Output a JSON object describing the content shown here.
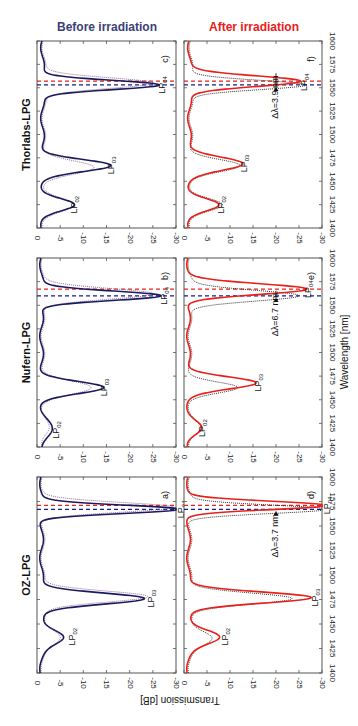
{
  "figure": {
    "column_titles": [
      {
        "label": "Before irradiation",
        "color": "#3b3f7a"
      },
      {
        "label": "After irradiation",
        "color": "#e8201a"
      }
    ],
    "row_titles": [
      "Thorlabs-LPG",
      "Nufern-LPG",
      "OZ-LPG"
    ],
    "xlabel": "Wavelength [nm]",
    "ylabel": "Transmission [dB]",
    "colors": {
      "before_solid": "#1a1a5e",
      "before_dotted": "#9a6a9a",
      "after_solid": "#e8201a",
      "after_dotted": "#333333",
      "dash_blue": "#1a1a8a",
      "dash_red": "#e8201a"
    }
  },
  "chart_data": [
    {
      "panel": "c)",
      "title": "Thorlabs-LPG",
      "column": "Before irradiation",
      "type": "line",
      "xlabel": "Wavelength [nm]",
      "ylabel": "Transmission [dB]",
      "xlim": [
        1400,
        1600
      ],
      "ylim": [
        -30,
        0
      ],
      "xticks": [
        1400,
        1425,
        1450,
        1475,
        1500,
        1525,
        1550,
        1575,
        1600
      ],
      "yticks": [
        0,
        -5,
        -10,
        -15,
        -20,
        -25,
        -30
      ],
      "annotations": [
        {
          "text": "LP02",
          "x": 1425,
          "y": -6.5
        },
        {
          "text": "LP03",
          "x": 1467,
          "y": -14.5
        },
        {
          "text": "LP04",
          "x": 1553,
          "y": -25.5
        }
      ],
      "vlines": [
        {
          "x": 1553,
          "color": "blue"
        },
        {
          "x": 1557,
          "color": "red"
        }
      ],
      "dips": [
        {
          "center": 1425,
          "depth": 6.5,
          "width": 9
        },
        {
          "center": 1467,
          "depth": 14.5,
          "width": 9
        },
        {
          "center": 1553,
          "depth": 25.5,
          "width": 7
        }
      ],
      "dips_ref": [
        {
          "center": 1425,
          "depth": 6.0,
          "width": 10
        },
        {
          "center": 1465,
          "depth": 10.5,
          "width": 10
        },
        {
          "center": 1555,
          "depth": 24,
          "width": 8
        }
      ],
      "baseline": -1.2,
      "series": [
        {
          "name": "before (solid)",
          "style": "solid"
        },
        {
          "name": "reference (dotted)",
          "style": "dotted"
        }
      ]
    },
    {
      "panel": "f)",
      "title": "Thorlabs-LPG",
      "column": "After irradiation",
      "type": "line",
      "xlim": [
        1400,
        1600
      ],
      "ylim": [
        -30,
        0
      ],
      "xticks": [
        1400,
        1425,
        1450,
        1475,
        1500,
        1525,
        1550,
        1575,
        1600
      ],
      "yticks": [
        0,
        -5,
        -10,
        -15,
        -20,
        -25,
        -30
      ],
      "annotations": [
        {
          "text": "LP02",
          "x": 1425,
          "y": -6.5
        },
        {
          "text": "LP03",
          "x": 1469,
          "y": -11.5
        },
        {
          "text": "LP04",
          "x": 1556,
          "y": -24.5
        },
        {
          "text": "Δλ=3.9 nm",
          "x": 1540,
          "y": -20,
          "arrow_to": 1553
        }
      ],
      "vlines": [
        {
          "x": 1553,
          "color": "blue"
        },
        {
          "x": 1557,
          "color": "red"
        }
      ],
      "dips": [
        {
          "center": 1425,
          "depth": 6.0,
          "width": 9
        },
        {
          "center": 1469,
          "depth": 11.5,
          "width": 10
        },
        {
          "center": 1557,
          "depth": 24.5,
          "width": 8
        }
      ],
      "dips_ref": [
        {
          "center": 1425,
          "depth": 6.5,
          "width": 9
        },
        {
          "center": 1467,
          "depth": 10.5,
          "width": 9
        },
        {
          "center": 1553,
          "depth": 25.5,
          "width": 7
        }
      ],
      "baseline": -1.2,
      "series": [
        {
          "name": "after (solid red)",
          "style": "solid"
        },
        {
          "name": "before (dotted black)",
          "style": "dotted"
        }
      ]
    },
    {
      "panel": "b)",
      "title": "Nufern-LPG",
      "column": "Before irradiation",
      "type": "line",
      "xlim": [
        1400,
        1600
      ],
      "ylim": [
        -30,
        0
      ],
      "xticks": [
        1400,
        1425,
        1450,
        1475,
        1500,
        1525,
        1550,
        1575,
        1600
      ],
      "yticks": [
        0,
        -5,
        -10,
        -15,
        -20,
        -25,
        -30
      ],
      "annotations": [
        {
          "text": "LP02",
          "x": 1418,
          "y": -2.5
        },
        {
          "text": "LP03",
          "x": 1463,
          "y": -13
        },
        {
          "text": "LP04",
          "x": 1560,
          "y": -26
        }
      ],
      "vlines": [
        {
          "x": 1560,
          "color": "blue"
        },
        {
          "x": 1567,
          "color": "red"
        }
      ],
      "dips": [
        {
          "center": 1418,
          "depth": 2.0,
          "width": 14
        },
        {
          "center": 1463,
          "depth": 13,
          "width": 9
        },
        {
          "center": 1560,
          "depth": 26,
          "width": 7
        }
      ],
      "dips_ref": [
        {
          "center": 1420,
          "depth": 1.0,
          "width": 10
        },
        {
          "center": 1463,
          "depth": 10,
          "width": 10
        },
        {
          "center": 1562,
          "depth": 24,
          "width": 8
        }
      ],
      "baseline": -1.0,
      "series": [
        {
          "name": "before (solid)",
          "style": "solid"
        },
        {
          "name": "reference (dotted)",
          "style": "dotted"
        }
      ]
    },
    {
      "panel": "e)",
      "title": "Nufern-LPG",
      "column": "After irradiation",
      "type": "line",
      "xlim": [
        1400,
        1600
      ],
      "ylim": [
        -30,
        0
      ],
      "xticks": [
        1400,
        1425,
        1450,
        1475,
        1500,
        1525,
        1550,
        1575,
        1600
      ],
      "yticks": [
        0,
        -5,
        -10,
        -15,
        -20,
        -25,
        -30
      ],
      "annotations": [
        {
          "text": "LP02",
          "x": 1420,
          "y": -2.5
        },
        {
          "text": "LP03",
          "x": 1468,
          "y": -14.5
        },
        {
          "text": "LP04",
          "x": 1567,
          "y": -25.5
        },
        {
          "text": "Δλ=6.7 nm",
          "x": 1540,
          "y": -20,
          "arrow_to": 1560
        }
      ],
      "vlines": [
        {
          "x": 1560,
          "color": "blue"
        },
        {
          "x": 1567,
          "color": "red"
        }
      ],
      "dips": [
        {
          "center": 1420,
          "depth": 2.5,
          "width": 10
        },
        {
          "center": 1468,
          "depth": 14.5,
          "width": 9
        },
        {
          "center": 1567,
          "depth": 25.5,
          "width": 8
        }
      ],
      "dips_ref": [
        {
          "center": 1420,
          "depth": 2.0,
          "width": 10
        },
        {
          "center": 1463,
          "depth": 10,
          "width": 8
        },
        {
          "center": 1560,
          "depth": 24,
          "width": 8
        }
      ],
      "baseline": -1.0,
      "series": [
        {
          "name": "after (solid red)",
          "style": "solid"
        },
        {
          "name": "before (dotted black)",
          "style": "dotted"
        }
      ]
    },
    {
      "panel": "a)",
      "title": "OZ-LPG",
      "column": "Before irradiation",
      "type": "line",
      "xlim": [
        1400,
        1600
      ],
      "ylim": [
        -30,
        0
      ],
      "xticks": [
        1400,
        1425,
        1450,
        1475,
        1500,
        1525,
        1550,
        1575,
        1600
      ],
      "yticks": [
        0,
        -5,
        -10,
        -15,
        -20,
        -25,
        -30
      ],
      "annotations": [
        {
          "text": "LP02",
          "x": 1437,
          "y": -6
        },
        {
          "text": "LP03",
          "x": 1476,
          "y": -23
        },
        {
          "text": "LP04",
          "x": 1567,
          "y": -29.5
        }
      ],
      "vlines": [
        {
          "x": 1567,
          "color": "blue"
        },
        {
          "x": 1571,
          "color": "red"
        }
      ],
      "dips": [
        {
          "center": 1437,
          "depth": 5,
          "width": 10
        },
        {
          "center": 1476,
          "depth": 22.5,
          "width": 8
        },
        {
          "center": 1567,
          "depth": 29.5,
          "width": 6
        }
      ],
      "dips_ref": [
        {
          "center": 1437,
          "depth": 4,
          "width": 10
        },
        {
          "center": 1478,
          "depth": 23,
          "width": 8
        },
        {
          "center": 1569,
          "depth": 28,
          "width": 7
        }
      ],
      "baseline": -1.0,
      "series": [
        {
          "name": "before (solid)",
          "style": "solid"
        },
        {
          "name": "reference (dotted)",
          "style": "dotted"
        }
      ]
    },
    {
      "panel": "d)",
      "title": "OZ-LPG",
      "column": "After irradiation",
      "type": "line",
      "xlim": [
        1400,
        1600
      ],
      "ylim": [
        -30,
        0
      ],
      "xticks": [
        1400,
        1425,
        1450,
        1475,
        1500,
        1525,
        1550,
        1575,
        1600
      ],
      "yticks": [
        0,
        -5,
        -10,
        -15,
        -20,
        -25,
        -30
      ],
      "annotations": [
        {
          "text": "LP02",
          "x": 1437,
          "y": -7.5
        },
        {
          "text": "LP03",
          "x": 1477,
          "y": -27
        },
        {
          "text": "LP04",
          "x": 1571,
          "y": -29.5
        },
        {
          "text": "Δλ=3.7 nm",
          "x": 1540,
          "y": -20,
          "arrow_to": 1567
        }
      ],
      "vlines": [
        {
          "x": 1567,
          "color": "blue"
        },
        {
          "x": 1571,
          "color": "red"
        }
      ],
      "dips": [
        {
          "center": 1437,
          "depth": 7,
          "width": 10
        },
        {
          "center": 1477,
          "depth": 27,
          "width": 8
        },
        {
          "center": 1571,
          "depth": 29.5,
          "width": 6
        }
      ],
      "dips_ref": [
        {
          "center": 1436,
          "depth": 5,
          "width": 10
        },
        {
          "center": 1476,
          "depth": 22.5,
          "width": 8
        },
        {
          "center": 1567,
          "depth": 29.5,
          "width": 6
        }
      ],
      "baseline": -1.0,
      "series": [
        {
          "name": "after (solid red)",
          "style": "solid"
        },
        {
          "name": "before (dotted black)",
          "style": "dotted"
        }
      ]
    }
  ]
}
